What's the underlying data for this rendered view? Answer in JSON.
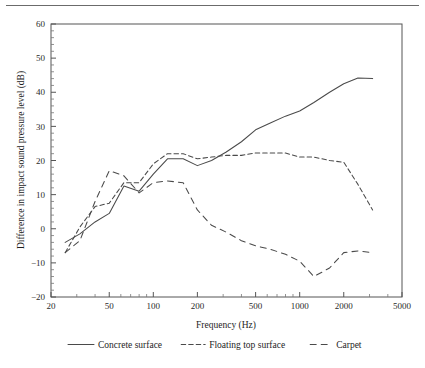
{
  "figure": {
    "has_top_rule": true,
    "background": "#ffffff",
    "line_color": "#4a4a4a"
  },
  "chart_data": {
    "type": "line",
    "title": "",
    "xlabel": "Frequency (Hz)",
    "ylabel": "Difference in impact sound pressure level (dB)",
    "xscale": "log",
    "xlim": [
      20,
      5000
    ],
    "ylim": [
      -20,
      60
    ],
    "xticks": [
      20,
      50,
      100,
      200,
      500,
      1000,
      2000,
      5000
    ],
    "xticklabels": [
      "20",
      "50",
      "100",
      "200",
      "500",
      "1000",
      "2000",
      "5000"
    ],
    "yticks": [
      -20,
      -10,
      0,
      10,
      20,
      30,
      40,
      50,
      60
    ],
    "yticklabels": [
      "−20",
      "−10",
      "0",
      "10",
      "20",
      "30",
      "40",
      "50",
      "60"
    ],
    "grid": false,
    "legend_position": "below",
    "series": [
      {
        "name": "Concrete surface",
        "style": "solid",
        "x": [
          25,
          31.5,
          40,
          50,
          63,
          80,
          100,
          125,
          160,
          200,
          250,
          315,
          400,
          500,
          630,
          800,
          1000,
          1250,
          1600,
          2000,
          2500,
          3150
        ],
        "y": [
          -4.0,
          -1.5,
          2.0,
          4.5,
          12.5,
          11.0,
          16.0,
          20.5,
          20.5,
          18.5,
          20.0,
          22.5,
          25.5,
          29.0,
          31.0,
          33.0,
          34.5,
          37.0,
          40.0,
          42.5,
          44.2,
          44.0
        ]
      },
      {
        "name": "Floating top surface",
        "style": "dashed-short",
        "x": [
          25,
          31.5,
          40,
          50,
          63,
          80,
          100,
          125,
          160,
          200,
          250,
          315,
          400,
          500,
          630,
          800,
          1000,
          1250,
          1600,
          2000,
          2500,
          3150
        ],
        "y": [
          -7.0,
          0.5,
          6.5,
          7.5,
          13.5,
          13.5,
          19.0,
          22.0,
          22.0,
          20.5,
          21.0,
          21.5,
          21.5,
          22.2,
          22.2,
          22.2,
          21.0,
          21.0,
          20.0,
          19.5,
          13.0,
          5.5
        ]
      },
      {
        "name": "Carpet",
        "style": "dashed-long",
        "x": [
          25,
          31.5,
          40,
          50,
          63,
          80,
          100,
          125,
          160,
          200,
          250,
          315,
          400,
          500,
          630,
          800,
          1000,
          1250,
          1600,
          2000,
          2500,
          3150
        ],
        "y": [
          -7.0,
          -3.5,
          8.0,
          17.0,
          15.5,
          10.5,
          13.5,
          14.0,
          13.5,
          5.5,
          1.0,
          -1.0,
          -3.5,
          -5.0,
          -6.0,
          -7.5,
          -9.5,
          -14.0,
          -11.5,
          -7.0,
          -6.5,
          -7.0
        ]
      }
    ]
  },
  "legend": {
    "items": [
      {
        "label": "Concrete surface",
        "style": "solid"
      },
      {
        "label": "Floating top surface",
        "style": "dashed-short"
      },
      {
        "label": "Carpet",
        "style": "dashed-long"
      }
    ]
  }
}
